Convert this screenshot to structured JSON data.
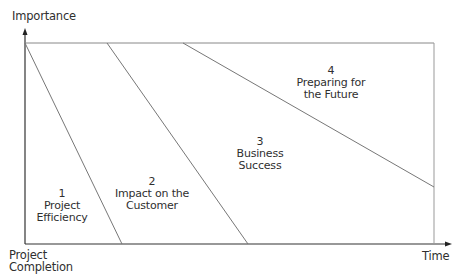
{
  "diagram": {
    "y_axis_label": "Importance",
    "x_axis_label": "Time",
    "origin_label_line1": "Project",
    "origin_label_line2": "Completion",
    "colors": {
      "axis": "#333333",
      "lines": "#777777",
      "text": "#2f2f2f"
    },
    "regions": [
      {
        "number": "1",
        "line1": "Project",
        "line2": "Efficiency"
      },
      {
        "number": "2",
        "line1": "Impact on the",
        "line2": "Customer"
      },
      {
        "number": "3",
        "line1": "Business",
        "line2": "Success"
      },
      {
        "number": "4",
        "line1": "Preparing for",
        "line2": "the Future"
      }
    ]
  }
}
